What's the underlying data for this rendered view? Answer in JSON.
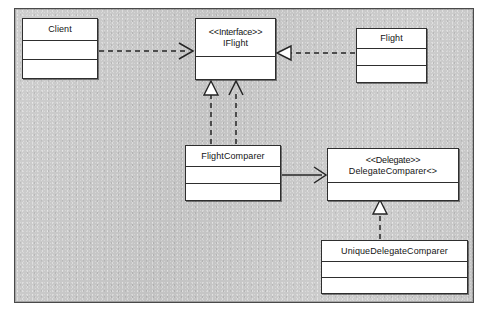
{
  "diagram": {
    "kind": "uml-class-diagram",
    "canvas_background_color": "#c9c9c9",
    "box_fill_color": "#ffffff",
    "line_color": "#262626",
    "classes": [
      {
        "id": "client",
        "name": "Client",
        "stereotype": "",
        "compartments": 3
      },
      {
        "id": "iflight",
        "name": "IFlight",
        "stereotype": "<<Interface>>",
        "compartments": 2
      },
      {
        "id": "flight",
        "name": "Flight",
        "stereotype": "",
        "compartments": 3
      },
      {
        "id": "flightcomparer",
        "name": "FlightComparer",
        "stereotype": "",
        "compartments": 3
      },
      {
        "id": "delegatecomparer",
        "name": "DelegateComparer<>",
        "stereotype": "<<Delegate>>",
        "compartments": 2
      },
      {
        "id": "uniquedelegatecomparer",
        "name": "UniqueDelegateComparer",
        "stereotype": "",
        "compartments": 3
      }
    ],
    "relationships": [
      {
        "id": "client-uses-iflight",
        "from": "client",
        "to": "iflight",
        "type": "dependency",
        "line": "dashed",
        "arrowhead": "open"
      },
      {
        "id": "flight-realizes-iflight",
        "from": "flight",
        "to": "iflight",
        "type": "realization",
        "line": "dashed",
        "arrowhead": "hollow-triangle"
      },
      {
        "id": "flightcomparer-realizes-iflight",
        "from": "flightcomparer",
        "to": "iflight",
        "type": "realization",
        "line": "dashed",
        "arrowhead": "hollow-triangle"
      },
      {
        "id": "flightcomparer-uses-iflight",
        "from": "flightcomparer",
        "to": "iflight",
        "type": "dependency",
        "line": "dashed",
        "arrowhead": "open"
      },
      {
        "id": "flightcomparer-associates-delegatecomparer",
        "from": "flightcomparer",
        "to": "delegatecomparer",
        "type": "association",
        "line": "solid",
        "arrowhead": "open"
      },
      {
        "id": "uniquedelegatecomparer-realizes-delegatecomparer",
        "from": "uniquedelegatecomparer",
        "to": "delegatecomparer",
        "type": "realization",
        "line": "dashed",
        "arrowhead": "hollow-triangle"
      }
    ]
  }
}
